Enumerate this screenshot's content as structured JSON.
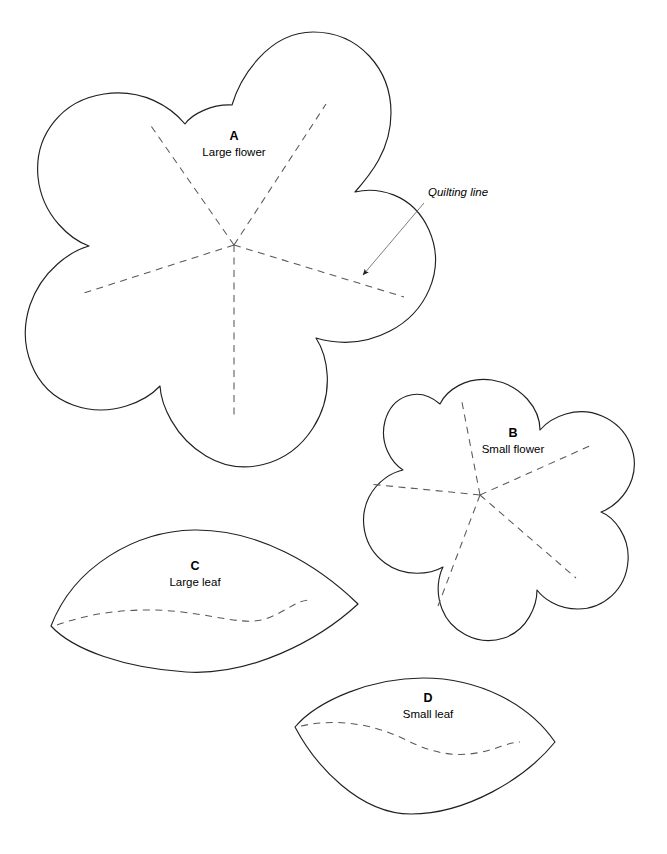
{
  "page": {
    "background_color": "#ffffff",
    "outline_color": "#231f20",
    "dash_color": "#58585a",
    "leader_color": "#6d6e71",
    "text_color": "#000000",
    "width": 667,
    "height": 854
  },
  "pieces": [
    {
      "id": "piece-a",
      "letter": "A",
      "name": "Large flower",
      "shape": "five-petal-flower",
      "letter_pos": {
        "x": 234,
        "y": 140
      },
      "name_pos": {
        "x": 234,
        "y": 156
      },
      "center": {
        "x": 234,
        "y": 245
      },
      "petal_count": 5,
      "quilting_lines": 5
    },
    {
      "id": "piece-b",
      "letter": "B",
      "name": "Small flower",
      "shape": "five-petal-flower",
      "letter_pos": {
        "x": 513,
        "y": 437
      },
      "name_pos": {
        "x": 513,
        "y": 453
      },
      "center": {
        "x": 480,
        "y": 495
      },
      "petal_count": 5,
      "quilting_lines": 5
    },
    {
      "id": "piece-c",
      "letter": "C",
      "name": "Large leaf",
      "shape": "pointed-oval-leaf",
      "letter_pos": {
        "x": 195,
        "y": 570
      },
      "name_pos": {
        "x": 195,
        "y": 586
      },
      "quilting_lines": 1
    },
    {
      "id": "piece-d",
      "letter": "D",
      "name": "Small leaf",
      "shape": "pointed-oval-leaf",
      "letter_pos": {
        "x": 428,
        "y": 702
      },
      "name_pos": {
        "x": 428,
        "y": 718
      },
      "quilting_lines": 1
    }
  ],
  "callouts": [
    {
      "id": "quilting-line-callout",
      "label": "Quilting line",
      "label_pos": {
        "x": 428,
        "y": 196
      },
      "arrow_from": {
        "x": 424,
        "y": 203
      },
      "arrow_to": {
        "x": 361,
        "y": 277
      }
    }
  ]
}
